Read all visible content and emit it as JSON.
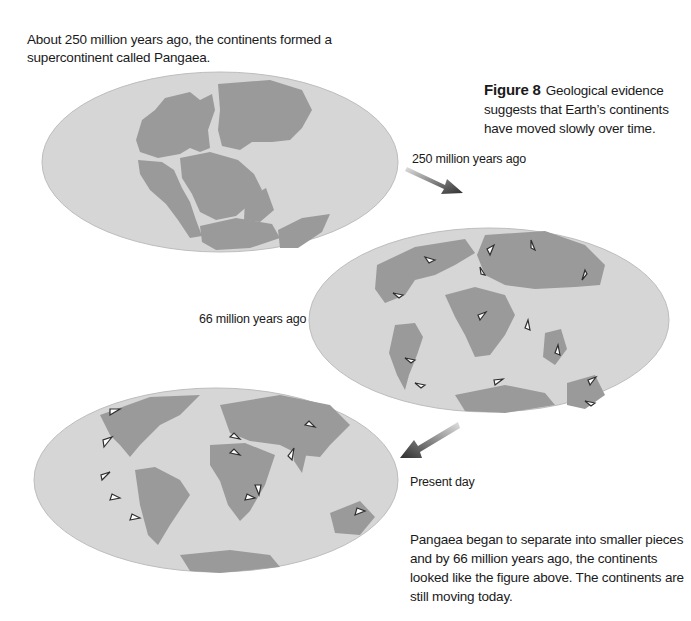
{
  "figure": {
    "number": "Figure 8",
    "caption": "Geological evidence suggests that Earth’s continents have moved slowly over time."
  },
  "top_caption": "About 250 million years ago, the continents formed a supercontinent called Pangaea.",
  "bottom_caption": "Pangaea began to separate into smaller pieces and by 66 million years ago, the continents looked like the figure above. The continents are still moving today.",
  "maps": [
    {
      "id": "pangaea",
      "label": "250 million years ago",
      "has_motion_arrows": false
    },
    {
      "id": "cretaceous",
      "label": "66 million years ago",
      "has_motion_arrows": true
    },
    {
      "id": "present",
      "label": "Present day",
      "has_motion_arrows": true
    }
  ],
  "colors": {
    "ocean": "#d6d6d6",
    "land": "#9a9a9a",
    "ocean_edge": "#b8b8b8",
    "arrow_dark": "#2e2e2e"
  }
}
